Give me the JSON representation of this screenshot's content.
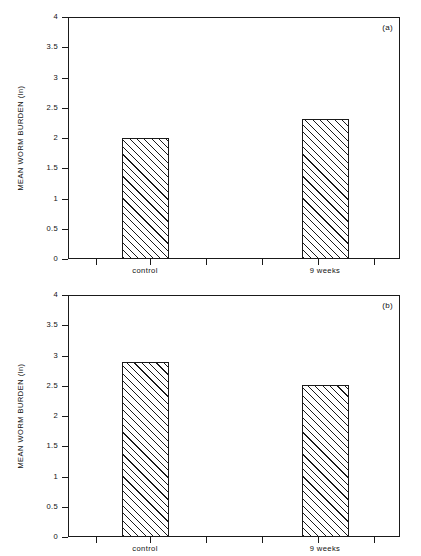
{
  "figure": {
    "background_color": "#ffffff",
    "axis_color": "#1a1a1a",
    "hatch_color": "#1a1a1a"
  },
  "chart_data": [
    {
      "type": "bar",
      "panel_label": "(a)",
      "title": "",
      "xlabel": "",
      "ylabel": "MEAN WORM BURDEN (ln)",
      "categories": [
        "control",
        "9 weeks"
      ],
      "values": [
        2.0,
        2.32
      ],
      "ylim": [
        0,
        4
      ],
      "yticks": [
        "0",
        "0.5",
        "1",
        "1.5",
        "2",
        "2.5",
        "3",
        "3.5",
        "4"
      ],
      "ytick_values": [
        0,
        0.5,
        1,
        1.5,
        2,
        2.5,
        3,
        3.5,
        4
      ],
      "grid": false,
      "legend": false
    },
    {
      "type": "bar",
      "panel_label": "(b)",
      "title": "",
      "xlabel": "",
      "ylabel": "MEAN WORM BURDEN (ln)",
      "categories": [
        "control",
        "9 weeks"
      ],
      "values": [
        2.89,
        2.52
      ],
      "ylim": [
        0,
        4
      ],
      "yticks": [
        "0",
        "0.5",
        "1",
        "1.5",
        "2",
        "2.5",
        "3",
        "3.5",
        "4"
      ],
      "ytick_values": [
        0,
        0.5,
        1,
        1.5,
        2,
        2.5,
        3,
        3.5,
        4
      ],
      "grid": false,
      "legend": false
    }
  ]
}
